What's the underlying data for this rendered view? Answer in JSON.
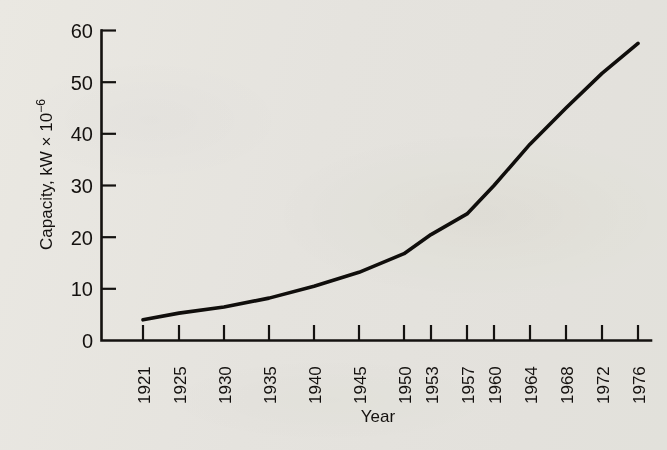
{
  "chart_data": {
    "type": "line",
    "title": "",
    "xlabel": "Year",
    "ylabel": "Capacity, kW × 10⁻⁶",
    "ylabel_base": "Capacity, kW × 10",
    "ylabel_exponent": "−6",
    "categories": [
      "1921",
      "1925",
      "1930",
      "1935",
      "1940",
      "1945",
      "1950",
      "1953",
      "1957",
      "1960",
      "1964",
      "1968",
      "1972",
      "1976"
    ],
    "x": [
      1921,
      1925,
      1930,
      1935,
      1940,
      1945,
      1950,
      1953,
      1957,
      1960,
      1964,
      1968,
      1972,
      1976
    ],
    "values": [
      4.0,
      5.3,
      6.5,
      8.2,
      10.5,
      13.2,
      16.8,
      20.5,
      24.5,
      30.0,
      38.0,
      45.0,
      51.7,
      57.5
    ],
    "series": [
      {
        "name": "Capacity",
        "values": [
          4.0,
          5.3,
          6.5,
          8.2,
          10.5,
          13.2,
          16.8,
          20.5,
          24.5,
          30.0,
          38.0,
          45.0,
          51.7,
          57.5
        ]
      }
    ],
    "ylim": [
      0,
      60
    ],
    "xlim": [
      1921,
      1976
    ],
    "yticks": [
      0,
      10,
      20,
      30,
      40,
      50,
      60
    ],
    "ytick_labels": [
      "0",
      "10",
      "20",
      "30",
      "40",
      "50",
      "60"
    ],
    "xticks": [
      1921,
      1925,
      1930,
      1935,
      1940,
      1945,
      1950,
      1953,
      1957,
      1960,
      1964,
      1968,
      1972,
      1976
    ],
    "xtick_labels": [
      "1921",
      "1925",
      "1930",
      "1935",
      "1940",
      "1945",
      "1950",
      "1953",
      "1957",
      "1960",
      "1964",
      "1968",
      "1972",
      "1976"
    ],
    "xtick_rotation": -90,
    "grid": false,
    "legend": false,
    "legend_position": "none",
    "line_color": "#100e0c",
    "background_color": "#f3f2ef",
    "axis_color": "#141210"
  }
}
